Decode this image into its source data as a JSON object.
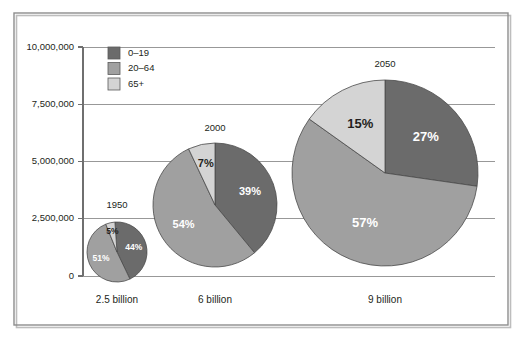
{
  "chart_data": {
    "type": "pie",
    "title": "",
    "subtitle": "",
    "xlabel": "",
    "ylabel": "",
    "grid": true,
    "legend_position": "top-left-inside",
    "ylim": [
      0,
      10000000
    ],
    "ytick_labels": [
      "10,000,000",
      "7,500,000",
      "5,000,000",
      "2,500,000",
      "0"
    ],
    "ytick_values": [
      10000000,
      7500000,
      5000000,
      2500000,
      0
    ],
    "categories": [
      "2.5 billion",
      "6 billion",
      "9 billion"
    ],
    "legend": [
      {
        "name": "0–19",
        "color": "#6b6b6b"
      },
      {
        "name": "20–64",
        "color": "#a0a0a0"
      },
      {
        "name": "65+",
        "color": "#d4d4d4"
      }
    ],
    "pies": [
      {
        "title": "1950",
        "category": "2.5 billion",
        "total_population": 2500000000,
        "slices": [
          {
            "name": "0–19",
            "value": 44,
            "label": "44%",
            "color": "#6b6b6b"
          },
          {
            "name": "20–64",
            "value": 51,
            "label": "51%",
            "color": "#a0a0a0"
          },
          {
            "name": "65+",
            "value": 5,
            "label": "5%",
            "color": "#d4d4d4"
          }
        ]
      },
      {
        "title": "2000",
        "category": "6 billion",
        "total_population": 6000000000,
        "slices": [
          {
            "name": "0–19",
            "value": 39,
            "label": "39%",
            "color": "#6b6b6b"
          },
          {
            "name": "20–64",
            "value": 54,
            "label": "54%",
            "color": "#a0a0a0"
          },
          {
            "name": "65+",
            "value": 7,
            "label": "7%",
            "color": "#d4d4d4"
          }
        ]
      },
      {
        "title": "2050",
        "category": "9 billion",
        "total_population": 9000000000,
        "slices": [
          {
            "name": "0–19",
            "value": 27,
            "label": "27%",
            "color": "#6b6b6b"
          },
          {
            "name": "20–64",
            "value": 57,
            "label": "57%",
            "color": "#a0a0a0"
          },
          {
            "name": "65+",
            "value": 15,
            "label": "15%",
            "color": "#d4d4d4"
          }
        ]
      }
    ]
  },
  "geometry": {
    "frame": {
      "x": 14,
      "y": 13,
      "width": 494,
      "height": 312
    },
    "plot": {
      "left": 83,
      "right": 495,
      "top": 47,
      "bottom": 276
    },
    "legend": {
      "x": 108,
      "y": 47,
      "swatch": 12,
      "row_gap": 15.5
    },
    "pies": [
      {
        "cx": 117,
        "cy": 252,
        "r": 30,
        "label_r_factor": 0.58,
        "title_dy": -44,
        "start_angle": -4
      },
      {
        "cx": 215,
        "cy": 205,
        "r": 62,
        "label_r_factor": 0.6,
        "title_dy": -74,
        "start_angle": 0
      },
      {
        "cx": 385,
        "cy": 173,
        "r": 93,
        "label_r_factor": 0.58,
        "title_dy": -106,
        "start_angle": 0
      }
    ],
    "xtick_label_y": 303,
    "label_font_sizes": [
      8.5,
      11,
      13
    ]
  }
}
